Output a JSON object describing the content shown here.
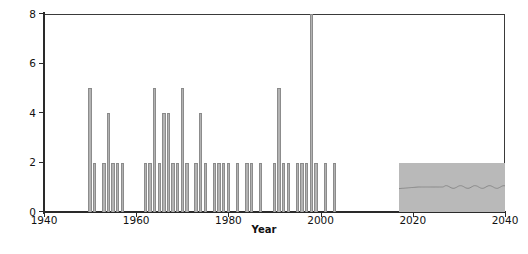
{
  "chart_data": {
    "type": "bar",
    "title": "",
    "xlabel": "Year",
    "ylabel": "Number of interstate war onsets",
    "xlim": [
      1940,
      2040
    ],
    "ylim": [
      0,
      8
    ],
    "xticks": [
      1940,
      1960,
      1980,
      2000,
      2020,
      2040
    ],
    "xtick_labels": [
      "1940",
      "1960",
      "1980",
      "2000",
      "2020",
      "2040"
    ],
    "yticks": [
      0,
      2,
      4,
      6,
      8
    ],
    "ytick_labels": [
      "0",
      "2",
      "4",
      "6",
      "8"
    ],
    "grid": false,
    "legend": null,
    "bar_color": "#b3b3b3",
    "bar_edge_color": "#8c8c8c",
    "axis_color": "#2a2a2a",
    "x": [
      1950,
      1951,
      1953,
      1954,
      1955,
      1956,
      1957,
      1962,
      1963,
      1964,
      1965,
      1966,
      1967,
      1968,
      1969,
      1970,
      1971,
      1973,
      1974,
      1975,
      1977,
      1978,
      1979,
      1980,
      1982,
      1984,
      1985,
      1987,
      1990,
      1991,
      1992,
      1993,
      1995,
      1996,
      1997,
      1998,
      1999,
      2001,
      2003
    ],
    "values": [
      5,
      2,
      2,
      4,
      2,
      2,
      2,
      2,
      2,
      5,
      2,
      4,
      4,
      2,
      2,
      5,
      2,
      2,
      4,
      2,
      2,
      2,
      2,
      2,
      2,
      2,
      2,
      2,
      2,
      5,
      2,
      2,
      2,
      2,
      2,
      8,
      2,
      2,
      2
    ],
    "annotations": [
      {
        "name": "forecast-band",
        "type": "shaded-region",
        "x_start": 2017,
        "x_end": 2040,
        "y_start": 0,
        "y_end": 2,
        "color": "#b9b9b9",
        "inner_line_y": 1,
        "inner_line_color": "#8a8a8a"
      }
    ]
  },
  "axes": {
    "y_title": "Number of interstate war onsets",
    "x_title": "Year",
    "y_labels": [
      "8",
      "6",
      "4",
      "2",
      "0"
    ],
    "x_labels": [
      "1940",
      "1960",
      "1980",
      "2000",
      "2020",
      "2040"
    ]
  }
}
